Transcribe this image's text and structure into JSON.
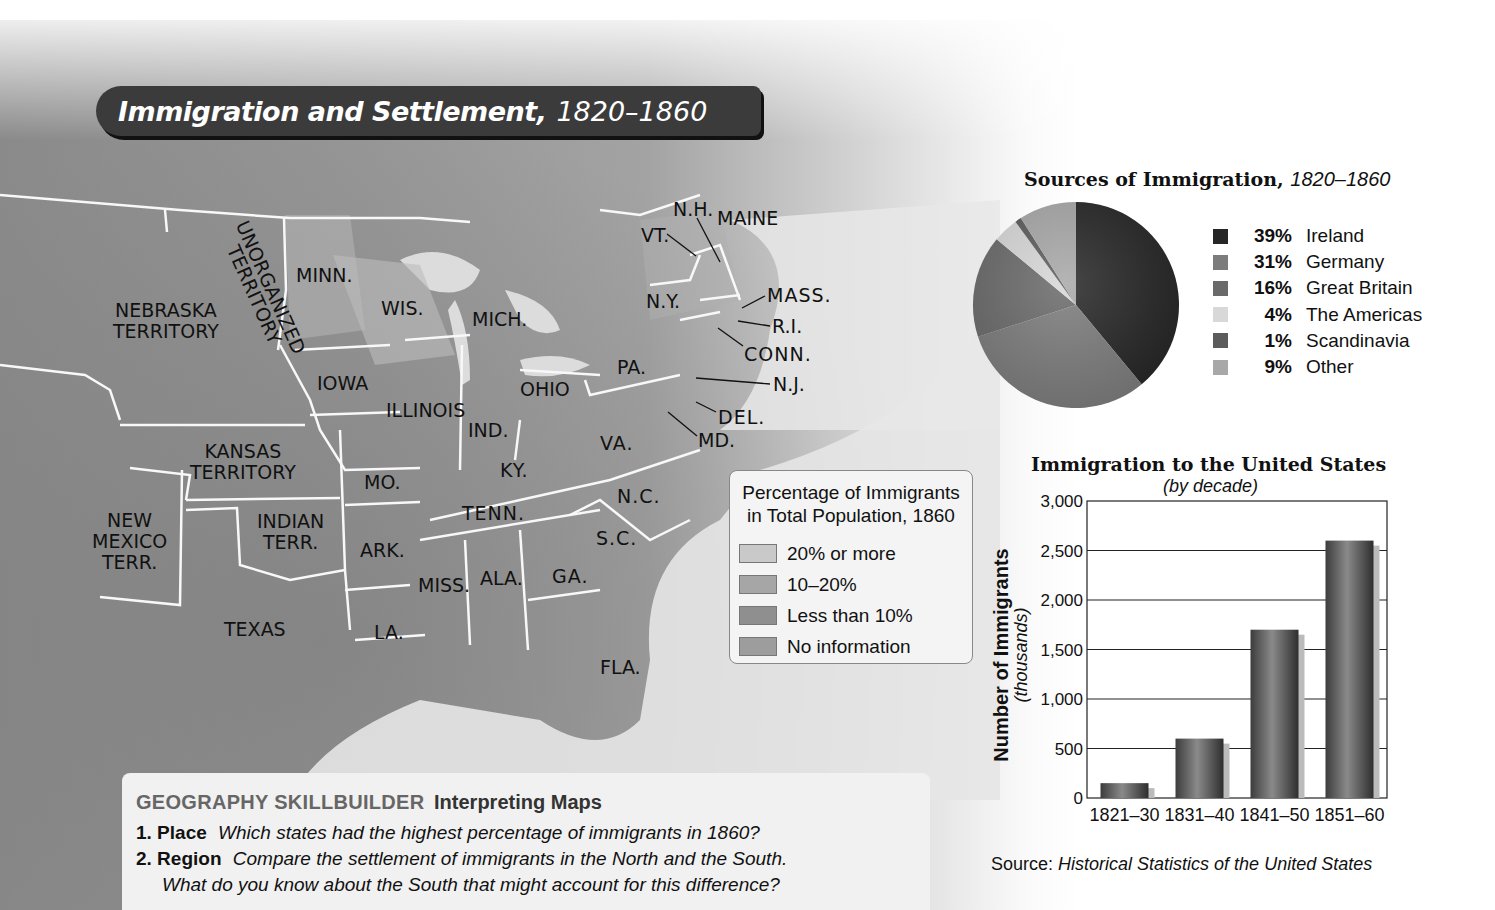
{
  "map": {
    "title": "Immigration and Settlement,",
    "title_years": "1820–1860",
    "labels": {
      "nebraska": "NEBRASKA\nTERRITORY",
      "unorganized": "UNORGANIZED\nTERRITORY",
      "minn": "MINN.",
      "wis": "WIS.",
      "mich": "MICH.",
      "iowa": "IOWA",
      "illinois": "ILLINOIS",
      "ind": "IND.",
      "ohio": "OHIO",
      "pa": "PA.",
      "ny": "N.Y.",
      "vt": "VT.",
      "nh": "N.H.",
      "maine": "MAINE",
      "mass": "MASS.",
      "ri": "R.I.",
      "conn": "CONN.",
      "nj": "N.J.",
      "del": "DEL.",
      "md": "MD.",
      "va": "VA.",
      "kansas": "KANSAS\nTERRITORY",
      "mo": "MO.",
      "ky": "KY.",
      "nc": "N.C.",
      "tenn": "TENN.",
      "sc": "S.C.",
      "new_mexico": "NEW\nMEXICO\nTERR.",
      "indian": "INDIAN\nTERR.",
      "ark": "ARK.",
      "miss": "MISS.",
      "ala": "ALA.",
      "ga": "GA.",
      "texas": "TEXAS",
      "la": "LA.",
      "fla": "FLA."
    },
    "legend": {
      "title_line1": "Percentage of Immigrants",
      "title_line2": "in Total Population, 1860",
      "items": [
        {
          "label": "20% or more",
          "color": "#c9c9c9"
        },
        {
          "label": "10–20%",
          "color": "#a6a6a6"
        },
        {
          "label": "Less than 10%",
          "color": "#8f8f8f"
        },
        {
          "label": "No information",
          "color": "#9d9d9d"
        }
      ]
    }
  },
  "skillbuilder": {
    "heading_caps": "GEOGRAPHY SKILLBUILDER",
    "heading_topic": "Interpreting Maps",
    "questions": [
      {
        "num": "1. Place",
        "text": "Which states had the highest percentage of immigrants in 1860?"
      },
      {
        "num": "2. Region",
        "text": "Compare the settlement of immigrants in the North and the South."
      }
    ],
    "continuation": "What do you know about the South that might account for this difference?"
  },
  "source": {
    "prefix": "Source:",
    "title": "Historical Statistics of the United States"
  },
  "chart_data": [
    {
      "type": "pie",
      "title": "Sources of Immigration, 1820–1860",
      "categories": [
        "Ireland",
        "Germany",
        "Great Britain",
        "The Americas",
        "Scandinavia",
        "Other"
      ],
      "values": [
        39,
        31,
        16,
        4,
        1,
        9
      ],
      "labels": [
        "39%",
        "31%",
        "16%",
        "4%",
        "1%",
        "9%"
      ],
      "colors": [
        "#262626",
        "#7c7c7c",
        "#6a6a6a",
        "#d8d8d8",
        "#5c5c5c",
        "#a8a8a8"
      ],
      "legend_position": "right"
    },
    {
      "type": "bar",
      "title": "Immigration to the United States",
      "subtitle": "(by decade)",
      "categories": [
        "1821–30",
        "1831–40",
        "1841–50",
        "1851–60"
      ],
      "values": [
        150,
        600,
        1700,
        2600
      ],
      "xlabel": "",
      "ylabel": "Number of Immigrants",
      "ylabel_sub": "(thousands)",
      "ylim": [
        0,
        3000
      ],
      "yticks": [
        "0",
        "500",
        "1,000",
        "1,500",
        "2,000",
        "2,500",
        "3,000"
      ],
      "grid": true
    }
  ]
}
